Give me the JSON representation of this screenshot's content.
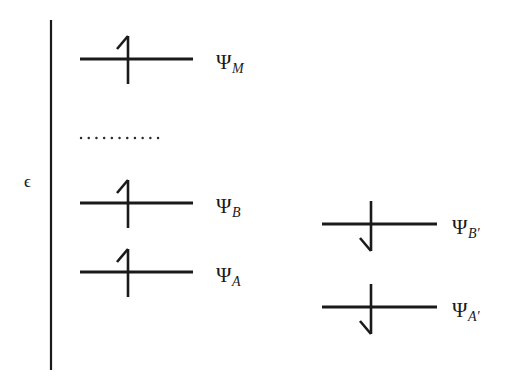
{
  "figure": {
    "type": "energy-level-diagram",
    "background_color": "#ffffff",
    "ink_color": "#1a1a1a"
  },
  "axis": {
    "name": "energy-axis",
    "label": "ϵ",
    "orientation": "vertical",
    "x": 51,
    "y_top": 20,
    "y_bottom": 370,
    "label_x": 24,
    "label_y": 173
  },
  "separator": {
    "name": "dotted-separator",
    "style": "dotted",
    "x_start": 81,
    "x_end": 161,
    "y": 138,
    "dot_count": 11
  },
  "levels": [
    {
      "id": "psi-m",
      "label_psi": "Ψ",
      "label_sub": "M",
      "column": "left",
      "line_x_start": 80,
      "line_x_end": 193,
      "line_y": 59,
      "stem_x": 128,
      "stem_y_top": 36,
      "stem_y_bottom": 84,
      "spin": "up",
      "label_x": 216,
      "label_y": 52
    },
    {
      "id": "psi-b",
      "label_psi": "Ψ",
      "label_sub": "B",
      "column": "left",
      "line_x_start": 80,
      "line_x_end": 193,
      "line_y": 203,
      "stem_x": 128,
      "stem_y_top": 180,
      "stem_y_bottom": 228,
      "spin": "up",
      "label_x": 216,
      "label_y": 196
    },
    {
      "id": "psi-a",
      "label_psi": "Ψ",
      "label_sub": "A",
      "column": "left",
      "line_x_start": 80,
      "line_x_end": 193,
      "line_y": 272,
      "stem_x": 128,
      "stem_y_top": 249,
      "stem_y_bottom": 297,
      "spin": "up",
      "label_x": 216,
      "label_y": 265
    },
    {
      "id": "psi-b-prime",
      "label_psi": "Ψ",
      "label_sub": "B′",
      "column": "right",
      "line_x_start": 322,
      "line_x_end": 437,
      "line_y": 224,
      "stem_x": 371,
      "stem_y_top": 201,
      "stem_y_bottom": 251,
      "spin": "down",
      "label_x": 452,
      "label_y": 217
    },
    {
      "id": "psi-a-prime",
      "label_psi": "Ψ",
      "label_sub": "A′",
      "column": "right",
      "line_x_start": 322,
      "line_x_end": 437,
      "line_y": 307,
      "stem_x": 371,
      "stem_y_top": 284,
      "stem_y_bottom": 334,
      "spin": "down",
      "label_x": 452,
      "label_y": 300
    }
  ]
}
